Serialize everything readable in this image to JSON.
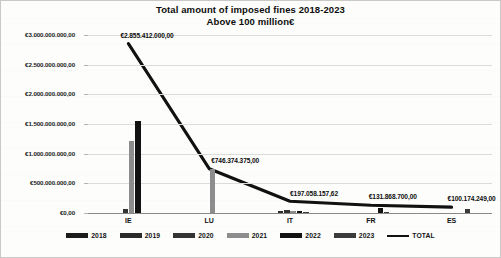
{
  "chart_data": {
    "type": "bar",
    "title": "Total amount of imposed fines 2018-2023",
    "subtitle": "Above 100 million€",
    "xlabel": "",
    "ylabel": "",
    "ylim": [
      0,
      3000000000
    ],
    "grid": true,
    "legend_position": "bottom",
    "categories": [
      "IE",
      "LU",
      "IT",
      "FR",
      "ES"
    ],
    "ytick_labels": [
      "€3.000.000.000,00",
      "€2.500.000.000,00",
      "€2.000.000.000,00",
      "€1.500.000.000,00",
      "€1.000.000.000,00",
      "€500.000.000,00",
      "€0,00"
    ],
    "ytick_values": [
      3000000000,
      2500000000,
      2000000000,
      1500000000,
      1000000000,
      500000000,
      0
    ],
    "series": [
      {
        "name": "2018",
        "color": "#1c1c1c",
        "values": [
          0,
          0,
          0,
          0,
          0
        ]
      },
      {
        "name": "2019",
        "color": "#2a2a2a",
        "values": [
          0,
          0,
          27800000,
          0,
          0
        ]
      },
      {
        "name": "2020",
        "color": "#333333",
        "values": [
          75000000,
          0,
          45000000,
          0,
          0
        ]
      },
      {
        "name": "2021",
        "color": "#8d8d8d",
        "values": [
          1215000000,
          746374375,
          36000000,
          0,
          0
        ]
      },
      {
        "name": "2022",
        "color": "#121212",
        "values": [
          1550000000,
          0,
          28000000,
          88000000,
          0
        ]
      },
      {
        "name": "2023",
        "color": "#3b3b3b",
        "values": [
          0,
          0,
          18000000,
          22000000,
          62000000
        ]
      }
    ],
    "total_line": {
      "name": "TOTAL",
      "color": "#111111",
      "values": [
        2855412000,
        746374375,
        197058157.62,
        131868700,
        100174249
      ],
      "labels": [
        "€2.855.412.000,00",
        "€746.374.375,00",
        "€197.058.157,62",
        "€131.868.700,00",
        "€100.174.249,00"
      ]
    }
  },
  "legend": {
    "items": [
      {
        "label": "2018",
        "color": "#1c1c1c",
        "kind": "bar"
      },
      {
        "label": "2019",
        "color": "#2a2a2a",
        "kind": "bar"
      },
      {
        "label": "2020",
        "color": "#333333",
        "kind": "bar"
      },
      {
        "label": "2021",
        "color": "#8d8d8d",
        "kind": "bar"
      },
      {
        "label": "2022",
        "color": "#121212",
        "kind": "bar"
      },
      {
        "label": "2023",
        "color": "#3b3b3b",
        "kind": "bar"
      },
      {
        "label": "TOTAL",
        "color": "#111111",
        "kind": "line"
      }
    ]
  }
}
